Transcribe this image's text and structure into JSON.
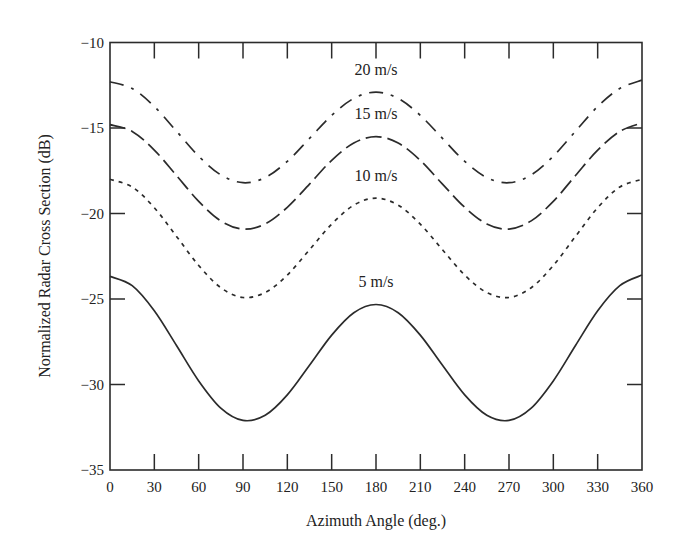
{
  "chart_data": {
    "type": "line",
    "title": "",
    "xlabel": "Azimuth Angle (deg.)",
    "ylabel": "Normalized Radar Cross Section (dB)",
    "xlim": [
      0,
      360
    ],
    "ylim": [
      -35,
      -10
    ],
    "xticks": [
      0,
      30,
      60,
      90,
      120,
      150,
      180,
      210,
      240,
      270,
      300,
      330,
      360
    ],
    "yticks": [
      -35,
      -30,
      -25,
      -20,
      -15,
      -10
    ],
    "grid": false,
    "legend": "inline labels",
    "x": [
      0,
      15,
      30,
      45,
      60,
      75,
      90,
      105,
      120,
      135,
      150,
      165,
      180,
      195,
      210,
      225,
      240,
      255,
      270,
      285,
      300,
      315,
      330,
      345,
      360
    ],
    "series": [
      {
        "name": "20 m/s",
        "style": "dash-dot",
        "label_pos": [
          180,
          -11.9
        ],
        "values": [
          -12.3,
          -12.69,
          -13.74,
          -15.19,
          -16.65,
          -17.74,
          -18.2,
          -17.9,
          -16.95,
          -15.61,
          -14.26,
          -13.27,
          -12.9,
          -13.27,
          -14.26,
          -15.61,
          -16.95,
          -17.9,
          -18.2,
          -17.74,
          -16.65,
          -15.19,
          -13.74,
          -12.69,
          -12.2
        ]
      },
      {
        "name": "15 m/s",
        "style": "long-dash",
        "label_pos": [
          180,
          -14.5
        ],
        "values": [
          -14.8,
          -15.2,
          -16.29,
          -17.78,
          -19.29,
          -20.43,
          -20.91,
          -20.61,
          -19.64,
          -18.28,
          -16.89,
          -15.88,
          -15.5,
          -15.88,
          -16.89,
          -18.28,
          -19.64,
          -20.61,
          -20.91,
          -20.43,
          -19.29,
          -17.78,
          -16.29,
          -15.2,
          -14.7
        ]
      },
      {
        "name": "10 m/s",
        "style": "short-dash",
        "label_pos": [
          180,
          -18.1
        ],
        "values": [
          -18.0,
          -18.45,
          -19.66,
          -21.34,
          -23.04,
          -24.34,
          -24.91,
          -24.62,
          -23.6,
          -22.12,
          -20.62,
          -19.51,
          -19.1,
          -19.51,
          -20.62,
          -22.12,
          -23.6,
          -24.62,
          -24.91,
          -24.34,
          -23.04,
          -21.34,
          -19.66,
          -18.45,
          -18.0
        ]
      },
      {
        "name": "5 m/s",
        "style": "solid",
        "label_pos": [
          180,
          -24.3
        ],
        "values": [
          -23.68,
          -24.22,
          -25.69,
          -27.72,
          -29.79,
          -31.38,
          -32.1,
          -31.8,
          -30.61,
          -28.88,
          -27.11,
          -25.8,
          -25.32,
          -25.8,
          -27.11,
          -28.88,
          -30.61,
          -31.8,
          -32.1,
          -31.38,
          -29.79,
          -27.72,
          -25.69,
          -24.22,
          -23.6
        ]
      }
    ]
  },
  "colors": {
    "line": "#2b2b2b",
    "axis": "#2b2b2b",
    "background": "#ffffff"
  }
}
